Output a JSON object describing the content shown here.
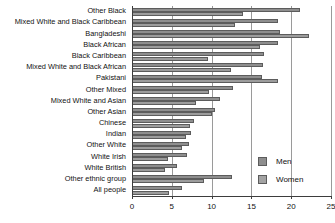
{
  "chart_data": {
    "type": "bar",
    "orientation": "horizontal",
    "title": "",
    "subtitle": "",
    "xlabel": "",
    "ylabel": "",
    "xlim": [
      0,
      25
    ],
    "ylim": null,
    "grid": true,
    "gridlines_x": [
      5,
      10,
      15,
      20,
      25
    ],
    "xticks": [
      0,
      5,
      10,
      15,
      20,
      25
    ],
    "xticklabels": [
      "0",
      "5",
      "10",
      "15",
      "20",
      "25"
    ],
    "legend_position": "inside-bottom-right",
    "categories": [
      "Other Black",
      "Mixed White and Black Caribbean",
      "Bangladeshi",
      "Black African",
      "Black Caribbean",
      "Mixed White and Black African",
      "Pakistani",
      "Other Mixed",
      "Mixed White and Asian",
      "Other Asian",
      "Chinese",
      "Indian",
      "Other White",
      "White Irish",
      "White British",
      "Other ethnic group",
      "All people"
    ],
    "series": [
      {
        "name": "Men",
        "color": "#8e8e8e",
        "values": [
          21.1,
          18.3,
          18.6,
          18.4,
          16.6,
          16.5,
          16.3,
          12.7,
          11.0,
          10.4,
          7.8,
          7.4,
          7.2,
          6.9,
          5.7,
          12.5,
          6.3
        ]
      },
      {
        "name": "Women",
        "color": "#9c9c9c",
        "values": [
          14.0,
          12.9,
          22.2,
          16.1,
          9.5,
          12.4,
          18.3,
          9.7,
          8.1,
          10.0,
          7.3,
          6.8,
          6.3,
          4.5,
          4.2,
          9.1,
          4.7
        ]
      }
    ]
  },
  "legend": {
    "items": [
      {
        "label": "Men",
        "color": "#8e8e8e"
      },
      {
        "label": "Women",
        "color": "#a3a3a3"
      }
    ]
  }
}
